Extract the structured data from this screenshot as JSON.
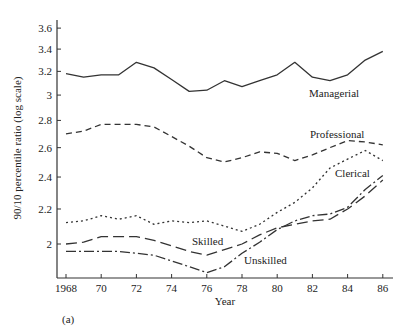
{
  "chart_data": {
    "type": "line",
    "title": "",
    "panel_label": "(a)",
    "xlabel": "Year",
    "ylabel": "90/10 percentile ratio (log scale)",
    "yscale": "log",
    "xlim": [
      1968,
      86
    ],
    "ylim": [
      1.8,
      3.65
    ],
    "grid": false,
    "legend": "inline labels",
    "x_ticks": [
      "1968",
      "70",
      "72",
      "74",
      "76",
      "78",
      "80",
      "82",
      "84",
      "86"
    ],
    "y_ticks": [
      "2",
      "2.2",
      "2.4",
      "2.6",
      "2.8",
      "3",
      "3.2",
      "3.4",
      "3.6"
    ],
    "x": [
      1968,
      1969,
      1970,
      1971,
      1972,
      1973,
      1974,
      1975,
      1976,
      1977,
      1978,
      1979,
      1980,
      1981,
      1982,
      1983,
      1984,
      1985,
      1986
    ],
    "series": [
      {
        "name": "Managerial",
        "style": "solid",
        "values": [
          3.18,
          3.15,
          3.17,
          3.17,
          3.28,
          3.23,
          3.13,
          3.03,
          3.04,
          3.12,
          3.07,
          3.12,
          3.17,
          3.28,
          3.15,
          3.12,
          3.17,
          3.3,
          3.38
        ]
      },
      {
        "name": "Professional",
        "style": "dashed",
        "values": [
          2.7,
          2.72,
          2.77,
          2.77,
          2.77,
          2.75,
          2.68,
          2.61,
          2.53,
          2.5,
          2.53,
          2.57,
          2.56,
          2.51,
          2.55,
          2.6,
          2.65,
          2.64,
          2.62
        ]
      },
      {
        "name": "Clerical",
        "style": "dotted",
        "values": [
          2.12,
          2.13,
          2.16,
          2.14,
          2.16,
          2.11,
          2.13,
          2.12,
          2.13,
          2.1,
          2.07,
          2.11,
          2.18,
          2.24,
          2.33,
          2.46,
          2.52,
          2.58,
          2.51
        ]
      },
      {
        "name": "Skilled",
        "style": "long-dashed",
        "values": [
          2.0,
          2.01,
          2.04,
          2.04,
          2.04,
          2.02,
          1.99,
          1.96,
          1.94,
          1.97,
          2.0,
          2.05,
          2.09,
          2.11,
          2.13,
          2.14,
          2.2,
          2.28,
          2.38
        ]
      },
      {
        "name": "Unskilled",
        "style": "dash-dot",
        "values": [
          1.96,
          1.96,
          1.96,
          1.96,
          1.95,
          1.94,
          1.91,
          1.88,
          1.85,
          1.88,
          1.95,
          2.01,
          2.08,
          2.13,
          2.16,
          2.17,
          2.21,
          2.32,
          2.41
        ]
      }
    ],
    "series_labels": [
      {
        "text": "Managerial",
        "x": 309,
        "y": 97
      },
      {
        "text": "Professional",
        "x": 310,
        "y": 138
      },
      {
        "text": "Clerical",
        "x": 335,
        "y": 177
      },
      {
        "text": "Skilled",
        "x": 192,
        "y": 245
      },
      {
        "text": "Unskilled",
        "x": 244,
        "y": 264
      }
    ]
  }
}
